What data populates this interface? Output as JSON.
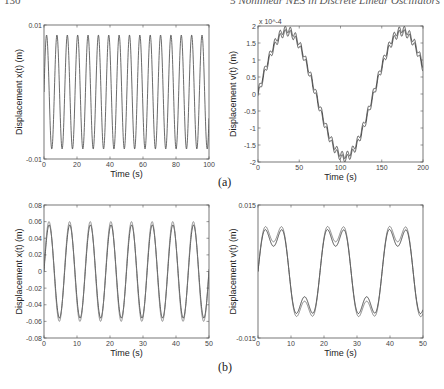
{
  "page": {
    "number": "130",
    "running_title": "5 Nonlinear NES in Discrete Linear Oscillators"
  },
  "panels": {
    "a": "(a)",
    "b": "(b)"
  },
  "chart_data": [
    {
      "id": "a-left",
      "type": "line",
      "title": "",
      "xlabel": "Time (s)",
      "ylabel": "Displacement x(t) (m)",
      "xlim": [
        0,
        100
      ],
      "ylim": [
        -0.01,
        0.01
      ],
      "xticks": [
        "0",
        "20",
        "40",
        "60",
        "80",
        "100"
      ],
      "yticks": [
        "-0.01",
        "0.01"
      ],
      "grid": false,
      "series": [
        {
          "name": "x(t)",
          "kind": "sine",
          "amplitude": 0.0085,
          "period": 6.28,
          "phase": 0,
          "color": "#444444"
        }
      ],
      "note": "16 near-constant-amplitude oscillation cycles over 0-100 s"
    },
    {
      "id": "a-right",
      "type": "line",
      "title": "",
      "xlabel": "Time (s)",
      "ylabel": "Displacement v(t) (m)",
      "multiplier_label": "x 10^-4",
      "xlim": [
        0,
        200
      ],
      "ylim": [
        -2,
        2
      ],
      "xticks": [
        "0",
        "50",
        "100",
        "150",
        "200"
      ],
      "yticks": [
        "-2",
        "-1.5",
        "-1",
        "-0.5",
        "0",
        "0.5",
        "1",
        "1.5",
        "2"
      ],
      "grid": false,
      "series": [
        {
          "name": "v(t) upper",
          "kind": "staircase-sine",
          "amplitude": 1.85,
          "period": 140,
          "ripple": 0.1,
          "ripple_period": 6.28,
          "offset": 0.05,
          "color": "#333333"
        },
        {
          "name": "v(t) lower",
          "kind": "staircase-sine",
          "amplitude": 1.85,
          "period": 140,
          "ripple": 0.1,
          "ripple_period": 6.28,
          "offset": -0.05,
          "color": "#333333"
        }
      ],
      "note": "slow sinusoid (peak ~1.9e-4 near t=35 and t=175, trough ~-1.9e-4 near t=105) with fast ripple; two nearly overlapping curves"
    },
    {
      "id": "b-left",
      "type": "line",
      "title": "",
      "xlabel": "Time (s)",
      "ylabel": "Displacement x(t) (m)",
      "xlim": [
        0,
        50
      ],
      "ylim": [
        -0.08,
        0.08
      ],
      "xticks": [
        "0",
        "10",
        "20",
        "30",
        "40",
        "50"
      ],
      "yticks": [
        "-0.08",
        "-0.06",
        "-0.04",
        "-0.02",
        "0",
        "0.02",
        "0.04",
        "0.06",
        "0.08"
      ],
      "grid": false,
      "series": [
        {
          "name": "x(t) exact",
          "kind": "sine",
          "amplitude": 0.056,
          "period": 6.25,
          "phase": 0,
          "color": "#222222"
        },
        {
          "name": "x(t) approx",
          "kind": "sine",
          "amplitude": 0.06,
          "period": 6.25,
          "phase": 0.05,
          "color": "#777777"
        }
      ],
      "note": "8 oscillation cycles over 0-50 s, peaks ~0.057-0.06"
    },
    {
      "id": "b-right",
      "type": "line",
      "title": "",
      "xlabel": "Time (s)",
      "ylabel": "Displacement v(t) (m)",
      "xlim": [
        0,
        50
      ],
      "ylim": [
        -0.015,
        0.015
      ],
      "xticks": [
        "0",
        "10",
        "20",
        "30",
        "40",
        "50"
      ],
      "yticks": [
        "-0.015",
        "0.015"
      ],
      "grid": false,
      "series": [
        {
          "name": "v(t) exact",
          "kind": "two-tone",
          "a1": 0.0095,
          "T1": 18.8,
          "a2": 0.0038,
          "T2": 6.27,
          "color": "#222222"
        },
        {
          "name": "v(t) approx",
          "kind": "two-tone",
          "a1": 0.0105,
          "T1": 18.8,
          "a2": 0.0038,
          "T2": 6.27,
          "color": "#666666"
        }
      ],
      "note": "peaks ~0.013 near t=5, 24, 43; troughs ~-0.013 near t=14, 33; plateaus near 0"
    }
  ]
}
